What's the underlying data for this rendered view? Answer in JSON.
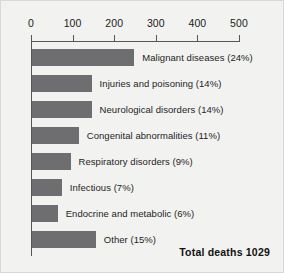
{
  "chart_data": {
    "type": "bar",
    "orientation": "horizontal",
    "title": "",
    "subtitle": "",
    "xlabel": "",
    "ylabel": "",
    "xlim": [
      0,
      500
    ],
    "grid": false,
    "legend": "none",
    "axis_ticks": [
      0,
      100,
      200,
      300,
      400,
      500
    ],
    "axis_tick_labels": [
      "0",
      "100",
      "200",
      "300",
      "400",
      "500"
    ],
    "categories": [
      "Malignant diseases",
      "Injuries and poisoning",
      "Neurological disorders",
      "Congenital abnormalities",
      "Respiratory disorders",
      "Infectious",
      "Endocrine and metabolic",
      "Other"
    ],
    "values": [
      247,
      144,
      144,
      113,
      93,
      72,
      62,
      154
    ],
    "percentages": [
      24,
      14,
      14,
      11,
      9,
      7,
      6,
      15
    ],
    "data_labels": [
      "Malignant diseases (24%)",
      "Injuries and poisoning (14%)",
      "Neurological disorders (14%)",
      "Congenital abnormalities (11%)",
      "Respiratory disorders (9%)",
      "Infectious (7%)",
      "Endocrine and metabolic (6%)",
      "Other (15%)"
    ],
    "annotations": [
      "Total deaths 1029"
    ],
    "bar_color": "#6e6e70",
    "axis_color": "#57575a",
    "background_color": "#f2f2f0"
  },
  "annotation": {
    "total_deaths": "Total deaths 1029"
  }
}
